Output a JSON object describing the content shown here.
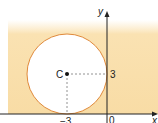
{
  "diagram": {
    "axes": {
      "x_label": "x",
      "y_label": "y",
      "origin_label": "0"
    },
    "center": {
      "label": "C",
      "coords": [
        -3,
        3
      ]
    },
    "ticks": {
      "x_tick": "−3",
      "y_tick": "3"
    },
    "circle": {
      "radius": 3,
      "stroke": "#e08a3c",
      "fill": "#ffffff"
    },
    "shading": {
      "color": "#f9dfa8",
      "region": "outside circle, above x-axis"
    },
    "guides": "dashed lines from C to each axis"
  }
}
